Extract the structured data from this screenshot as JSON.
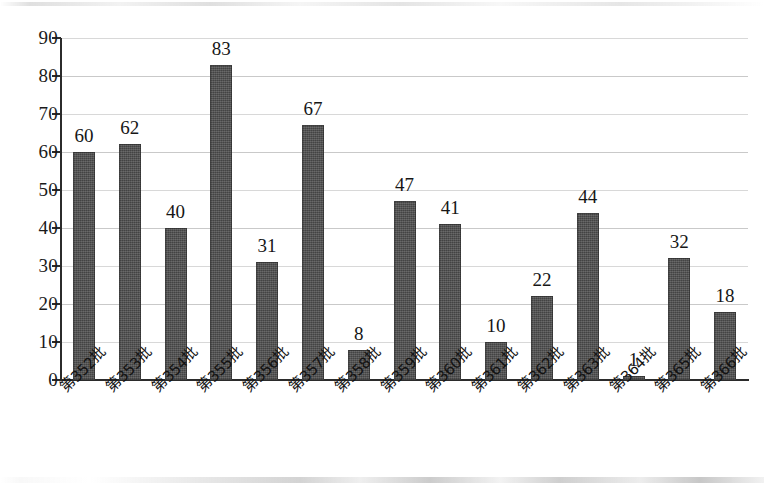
{
  "chart_data": {
    "type": "bar",
    "title": "",
    "subtitle": "",
    "xlabel": "",
    "ylabel": "",
    "ylim": [
      0,
      90
    ],
    "ytick_step": 10,
    "yticks": [
      90,
      80,
      70,
      60,
      50,
      40,
      30,
      20,
      10,
      0
    ],
    "grid": true,
    "legend": false,
    "legend_position": "none",
    "bar_color": "#4b4b4b",
    "gridline_color": "#c9c9c9",
    "axis_color": "#2b2b2b",
    "categories": [
      "第352批",
      "第353批",
      "第354批",
      "第355批",
      "第356批",
      "第357批",
      "第358批",
      "第359批",
      "第360批",
      "第361批",
      "第362批",
      "第363批",
      "第364批",
      "第365批",
      "第366批"
    ],
    "values": [
      60,
      62,
      40,
      83,
      31,
      67,
      8,
      47,
      41,
      10,
      22,
      44,
      1,
      32,
      18
    ],
    "data_labels": [
      "60",
      "62",
      "40",
      "83",
      "31",
      "67",
      "8",
      "47",
      "41",
      "10",
      "22",
      "44",
      "1",
      "32",
      "18"
    ]
  }
}
